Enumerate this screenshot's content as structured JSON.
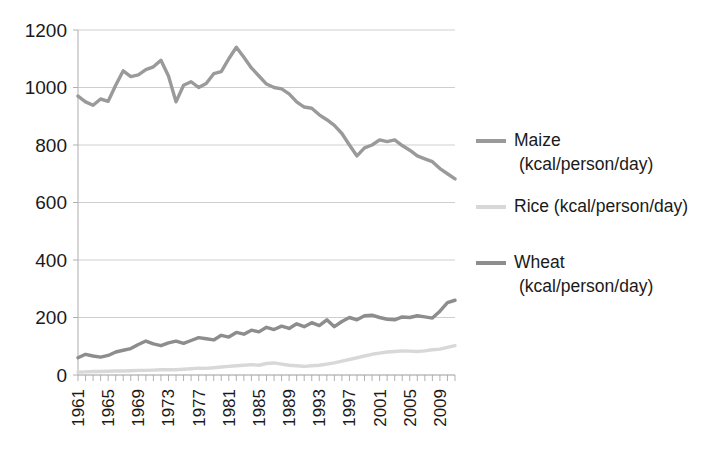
{
  "chart_data": {
    "type": "line",
    "title": "",
    "xlabel": "",
    "ylabel": "",
    "ylim": [
      0,
      1200
    ],
    "ytick_values": [
      0,
      200,
      400,
      600,
      800,
      1000,
      1200
    ],
    "ytick_labels": [
      "0",
      "200",
      "400",
      "600",
      "800",
      "1000",
      "1200"
    ],
    "grid": true,
    "legend_position": "right",
    "x": [
      1961,
      1962,
      1963,
      1964,
      1965,
      1966,
      1967,
      1968,
      1969,
      1970,
      1971,
      1972,
      1973,
      1974,
      1975,
      1976,
      1977,
      1978,
      1979,
      1980,
      1981,
      1982,
      1983,
      1984,
      1985,
      1986,
      1987,
      1988,
      1989,
      1990,
      1991,
      1992,
      1993,
      1994,
      1995,
      1996,
      1997,
      1998,
      1999,
      2000,
      2001,
      2002,
      2003,
      2004,
      2005,
      2006,
      2007,
      2008,
      2009,
      2010,
      2011
    ],
    "xtick_labels": [
      "1961",
      "1965",
      "1969",
      "1973",
      "1977",
      "1981",
      "1985",
      "1989",
      "1993",
      "1997",
      "2001",
      "2005",
      "2009"
    ],
    "xtick_values": [
      1961,
      1965,
      1969,
      1973,
      1977,
      1981,
      1985,
      1989,
      1993,
      1997,
      2001,
      2005,
      2009
    ],
    "series": [
      {
        "name": "Maize",
        "legend_label": "Maize\n(kcal/person/day)",
        "unit": "kcal/person/day",
        "color": "#9a9a9a",
        "values": [
          970,
          950,
          938,
          960,
          952,
          1008,
          1058,
          1038,
          1044,
          1062,
          1072,
          1095,
          1040,
          950,
          1008,
          1020,
          1000,
          1014,
          1048,
          1055,
          1100,
          1140,
          1105,
          1068,
          1040,
          1012,
          1000,
          995,
          978,
          950,
          932,
          928,
          905,
          888,
          868,
          840,
          800,
          762,
          790,
          800,
          818,
          812,
          818,
          798,
          782,
          762,
          752,
          742,
          718,
          700,
          682
        ]
      },
      {
        "name": "Rice",
        "legend_label": "Rice (kcal/person/day)",
        "unit": "kcal/person/day",
        "color": "#d8d8d8",
        "values": [
          10,
          11,
          12,
          12,
          13,
          14,
          14,
          15,
          16,
          16,
          17,
          18,
          18,
          18,
          20,
          22,
          24,
          23,
          25,
          28,
          30,
          32,
          34,
          36,
          34,
          40,
          42,
          38,
          34,
          32,
          30,
          32,
          34,
          38,
          42,
          48,
          54,
          60,
          66,
          72,
          76,
          80,
          82,
          84,
          83,
          82,
          84,
          88,
          90,
          96,
          102
        ]
      },
      {
        "name": "Wheat",
        "legend_label": "Wheat\n(kcal/person/day)",
        "unit": "kcal/person/day",
        "color": "#8d8d8d",
        "values": [
          60,
          72,
          66,
          62,
          68,
          80,
          86,
          92,
          106,
          118,
          108,
          102,
          112,
          118,
          110,
          120,
          130,
          126,
          122,
          138,
          132,
          148,
          142,
          156,
          150,
          166,
          158,
          170,
          162,
          178,
          168,
          182,
          172,
          192,
          168,
          186,
          200,
          192,
          206,
          208,
          200,
          194,
          192,
          202,
          200,
          206,
          202,
          198,
          222,
          252,
          260
        ]
      }
    ]
  },
  "legend": {
    "items": [
      {
        "label_line1": "Maize",
        "label_line2": "(kcal/person/day)",
        "swatch_name": "maize-legend-swatch"
      },
      {
        "label_line1": "Rice (kcal/person/day)",
        "label_line2": "",
        "swatch_name": "rice-legend-swatch"
      },
      {
        "label_line1": "Wheat",
        "label_line2": "(kcal/person/day)",
        "swatch_name": "wheat-legend-swatch"
      }
    ]
  }
}
